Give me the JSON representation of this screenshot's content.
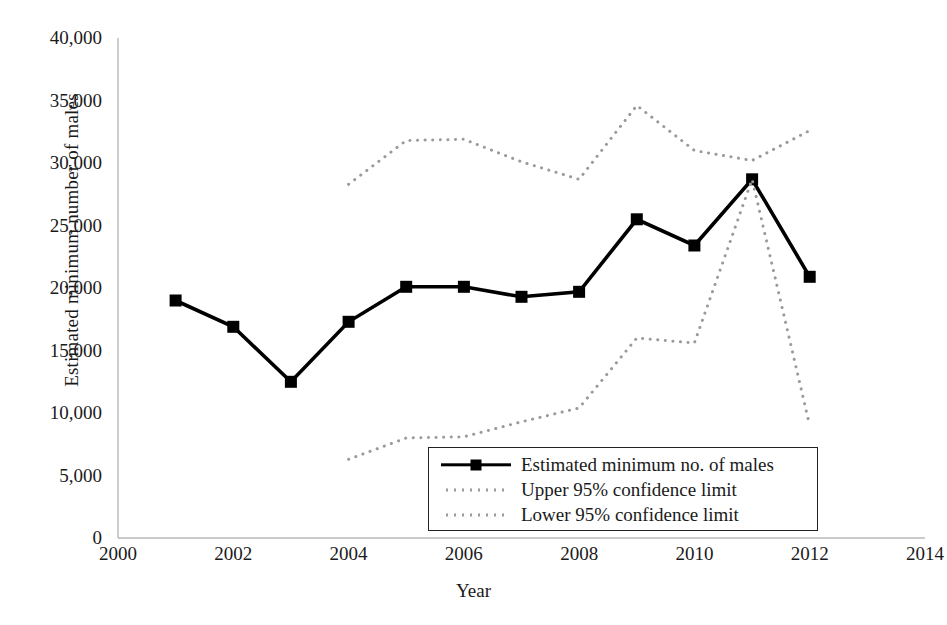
{
  "chart_data": {
    "type": "line",
    "title": "",
    "xlabel": "Year",
    "ylabel": "Estimated minimum number of males",
    "xlim": [
      2000,
      2014
    ],
    "ylim": [
      0,
      40000
    ],
    "xticks": [
      "2000",
      "2002",
      "2004",
      "2006",
      "2008",
      "2010",
      "2012",
      "2014"
    ],
    "xtick_values": [
      2000,
      2002,
      2004,
      2006,
      2008,
      2010,
      2012,
      2014
    ],
    "yticks": [
      "0",
      "5,000",
      "10,000",
      "15,000",
      "20,000",
      "25,000",
      "30,000",
      "35,000",
      "40,000"
    ],
    "ytick_values": [
      0,
      5000,
      10000,
      15000,
      20000,
      25000,
      30000,
      35000,
      40000
    ],
    "grid": false,
    "legend_position": "inside-bottom-center",
    "series": [
      {
        "name": "Estimated minimum no. of males",
        "style": "solid-square-marker",
        "color": "#000000",
        "x": [
          2001,
          2002,
          2003,
          2004,
          2005,
          2006,
          2007,
          2008,
          2009,
          2010,
          2011,
          2012
        ],
        "values": [
          19000,
          16900,
          12500,
          17300,
          20100,
          20100,
          19300,
          19700,
          25500,
          23400,
          28700,
          20900
        ]
      },
      {
        "name": "Upper 95% confidence limit",
        "style": "dotted",
        "color": "#9a9a9a",
        "x": [
          2004,
          2005,
          2006,
          2007,
          2008,
          2009,
          2010,
          2011,
          2012
        ],
        "values": [
          28300,
          31800,
          31900,
          30100,
          28700,
          34600,
          31000,
          30200,
          32600
        ]
      },
      {
        "name": "Lower 95% confidence limit",
        "style": "dotted",
        "color": "#9a9a9a",
        "x": [
          2004,
          2005,
          2006,
          2007,
          2008,
          2009,
          2010,
          2011,
          2012
        ],
        "values": [
          6300,
          8000,
          8100,
          9300,
          10400,
          16000,
          15600,
          28700,
          9000
        ]
      }
    ]
  },
  "legend": {
    "items": [
      {
        "label": "Estimated minimum no. of males",
        "key": "solid-square-line-key"
      },
      {
        "label": "Upper 95% confidence limit",
        "key": "dotted-line-key"
      },
      {
        "label": "Lower 95% confidence limit",
        "key": "dotted-line-key"
      }
    ]
  },
  "axes": {
    "y_title": "Estimated minimum number of males",
    "x_title": "Year"
  }
}
